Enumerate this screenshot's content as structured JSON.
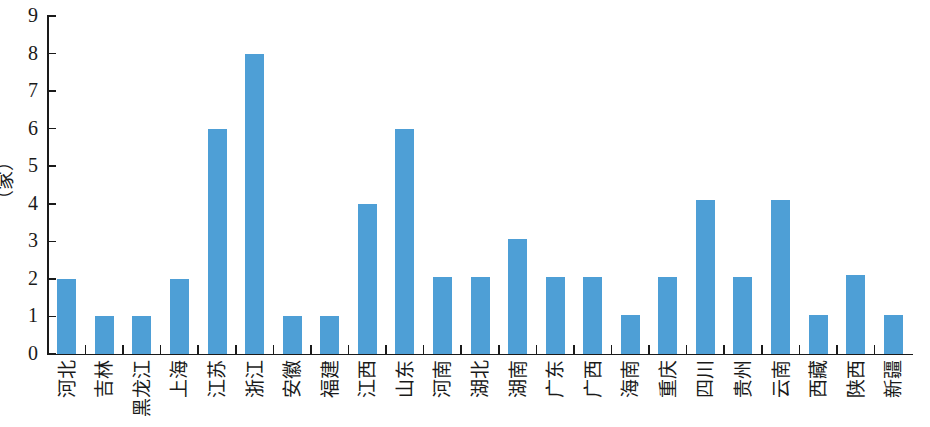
{
  "chart_data": {
    "type": "bar",
    "title": "",
    "subtitle": "",
    "xlabel": "",
    "ylabel": "（家）",
    "ylim": [
      0,
      9
    ],
    "ytick_labels": [
      "0",
      "1",
      "2",
      "3",
      "4",
      "5",
      "6",
      "7",
      "8",
      "9"
    ],
    "ytick_values": [
      0,
      1,
      2,
      3,
      4,
      5,
      6,
      7,
      8,
      9
    ],
    "grid": false,
    "legend": false,
    "bar_color": "#4e9fd6",
    "axis_color": "#1a1a1a",
    "categories": [
      "河北",
      "吉林",
      "黑龙江",
      "上海",
      "江苏",
      "浙江",
      "安徽",
      "福建",
      "江西",
      "山东",
      "河南",
      "湖北",
      "湖南",
      "广东",
      "广西",
      "海南",
      "重庆",
      "四川",
      "贵州",
      "云南",
      "西藏",
      "陕西",
      "新疆"
    ],
    "values": [
      2,
      1,
      1,
      2,
      6,
      8,
      1,
      1,
      4,
      6,
      2.05,
      2.05,
      3.05,
      2.05,
      2.05,
      1.05,
      2.05,
      4.1,
      2.05,
      4.1,
      1.05,
      2.1,
      1.05
    ],
    "values_rounded": [
      2,
      1,
      1,
      2,
      6,
      8,
      1,
      1,
      4,
      6,
      2,
      2,
      3,
      2,
      2,
      1,
      2,
      4,
      2,
      4,
      1,
      2,
      1
    ]
  }
}
